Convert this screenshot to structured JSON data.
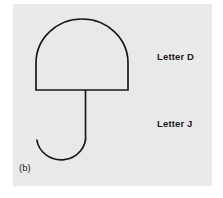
{
  "figure": {
    "caption": "(b)",
    "panel_color": "#e9e9e9",
    "background_color": "#ffffff",
    "stroke_color": "#1a1a1a",
    "diagram_name": "umbrella"
  },
  "annotations": [
    {
      "id": "letter-d",
      "text": "Letter D",
      "target": "umbrella-canopy"
    },
    {
      "id": "letter-j",
      "text": "Letter J",
      "target": "umbrella-handle"
    }
  ],
  "shapes": {
    "canopy": {
      "name": "umbrella-canopy",
      "description": "dome with flat base",
      "left": 36,
      "right": 128,
      "top": 19,
      "base_y": 90
    },
    "handle": {
      "name": "umbrella-handle",
      "description": "J-shaped hook",
      "stem_x": 85,
      "stem_top_y": 90,
      "hook_bottom_y": 157,
      "hook_tip_x": 37,
      "hook_tip_y": 139
    }
  }
}
